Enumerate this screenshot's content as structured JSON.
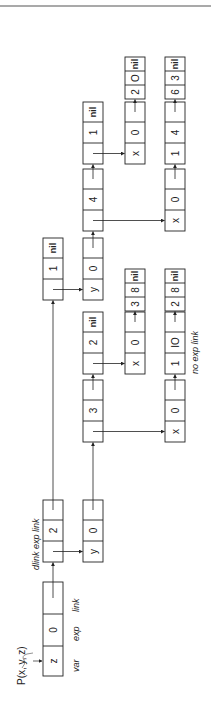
{
  "diagram": {
    "title": "P(x, y, z)",
    "orientation": "rotated 90 degrees counter-clockwise",
    "colors": {
      "ink": "#222222",
      "background": "#ffffff",
      "rule": "#555555"
    },
    "field_labels": {
      "var": "var",
      "exp": "exp",
      "link": "link",
      "dlink": "dlink",
      "exp_link": "exp link",
      "dlink_exp_link": "dlink exp link",
      "no_exp_link": "no exp link"
    },
    "nodes": [
      {
        "id": "root",
        "cells": [
          "z",
          "0",
          ""
        ],
        "kind": "var-exp-link"
      },
      {
        "id": "d2",
        "cells": [
          "",
          "2",
          ""
        ],
        "kind": "dlink-exp-link"
      },
      {
        "id": "y0a",
        "cells": [
          "y",
          "0",
          ""
        ]
      },
      {
        "id": "n3",
        "cells": [
          "",
          "3",
          ""
        ]
      },
      {
        "id": "n2nil",
        "cells": [
          "",
          "2",
          "nil"
        ]
      },
      {
        "id": "x0a",
        "cells": [
          "x",
          "0",
          ""
        ]
      },
      {
        "id": "t38",
        "cells": [
          "3",
          "8",
          "nil"
        ]
      },
      {
        "id": "x0b",
        "cells": [
          "x",
          "0",
          ""
        ]
      },
      {
        "id": "n110",
        "cells": [
          "1",
          "IO",
          ""
        ]
      },
      {
        "id": "t28",
        "cells": [
          "2",
          "8",
          "nil"
        ]
      },
      {
        "id": "n1nil_top",
        "cells": [
          "",
          "1",
          "nil"
        ]
      },
      {
        "id": "y0b",
        "cells": [
          "y",
          "0",
          ""
        ]
      },
      {
        "id": "n4",
        "cells": [
          "",
          "4",
          ""
        ]
      },
      {
        "id": "n1nil",
        "cells": [
          "",
          "1",
          "nil"
        ]
      },
      {
        "id": "x0c",
        "cells": [
          "x",
          "0",
          ""
        ]
      },
      {
        "id": "t20",
        "cells": [
          "2",
          "O",
          "nil"
        ]
      },
      {
        "id": "x0d",
        "cells": [
          "x",
          "0",
          ""
        ]
      },
      {
        "id": "n14",
        "cells": [
          "1",
          "4",
          ""
        ]
      },
      {
        "id": "t63",
        "cells": [
          "6",
          "3",
          "nil"
        ]
      }
    ]
  }
}
